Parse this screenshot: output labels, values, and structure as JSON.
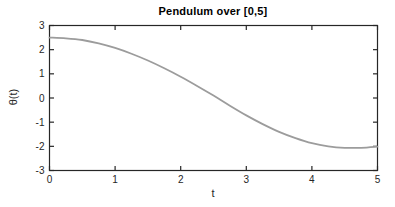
{
  "chart_data": {
    "type": "line",
    "title": "Pendulum over [0,5]",
    "xlabel": "t",
    "ylabel": "θ(t)",
    "xlim": [
      0,
      5
    ],
    "ylim": [
      -3,
      3
    ],
    "xticks": [
      0,
      1,
      2,
      3,
      4,
      5
    ],
    "yticks": [
      -3,
      -2,
      -1,
      0,
      1,
      2,
      3
    ],
    "grid": false,
    "box": true,
    "tick_direction": "in",
    "legend": "none",
    "axis_color": "#262626",
    "background_color": "#ffffff",
    "series": [
      {
        "name": "theta",
        "color": "#9c9c9c",
        "line_width": 1.8,
        "x": [
          0,
          0.25,
          0.5,
          0.75,
          1.0,
          1.25,
          1.5,
          1.75,
          2.0,
          2.25,
          2.5,
          2.75,
          3.0,
          3.25,
          3.5,
          3.75,
          4.0,
          4.25,
          4.5,
          4.75,
          5.0
        ],
        "y": [
          2.5,
          2.47,
          2.4,
          2.26,
          2.07,
          1.83,
          1.55,
          1.23,
          0.88,
          0.5,
          0.1,
          -0.32,
          -0.72,
          -1.08,
          -1.4,
          -1.66,
          -1.87,
          -2.0,
          -2.06,
          -2.06,
          -2.01
        ]
      }
    ]
  }
}
